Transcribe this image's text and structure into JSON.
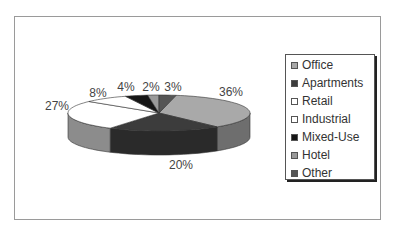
{
  "chart_data": {
    "type": "pie",
    "style": "3d-exploded-none",
    "title": "",
    "categories": [
      "Office",
      "Apartments",
      "Retail",
      "Industrial",
      "Mixed-Use",
      "Hotel",
      "Other"
    ],
    "values": [
      36,
      20,
      27,
      8,
      4,
      2,
      3
    ],
    "labels": [
      "36%",
      "20%",
      "27%",
      "8%",
      "4%",
      "2%",
      "3%"
    ],
    "colors": [
      "#a9a9a9",
      "#3c3c3c",
      "#ffffff",
      "#ffffff",
      "#161616",
      "#9a9a9a",
      "#555555"
    ],
    "side_colors": [
      "#6e6e6e",
      "#2a2a2a",
      "#8c8c8c",
      "#8c8c8c",
      "#111111",
      "#777777",
      "#3a3a3a"
    ],
    "legend_position": "right",
    "start_offset_percent": 3
  },
  "legend": {
    "items": [
      {
        "label": "Office",
        "color": "#a9a9a9"
      },
      {
        "label": "Apartments",
        "color": "#3c3c3c"
      },
      {
        "label": "Retail",
        "color": "#ffffff"
      },
      {
        "label": "Industrial",
        "color": "#ffffff"
      },
      {
        "label": "Mixed-Use",
        "color": "#161616"
      },
      {
        "label": "Hotel",
        "color": "#9a9a9a"
      },
      {
        "label": "Other",
        "color": "#555555"
      }
    ]
  },
  "data_labels": [
    {
      "text": "36%",
      "x": 231,
      "y": 92
    },
    {
      "text": "20%",
      "x": 181,
      "y": 165
    },
    {
      "text": "27%",
      "x": 57,
      "y": 106
    },
    {
      "text": "8%",
      "x": 98,
      "y": 93
    },
    {
      "text": "4%",
      "x": 126,
      "y": 87
    },
    {
      "text": "2%",
      "x": 151,
      "y": 87
    },
    {
      "text": "3%",
      "x": 173,
      "y": 87
    }
  ]
}
